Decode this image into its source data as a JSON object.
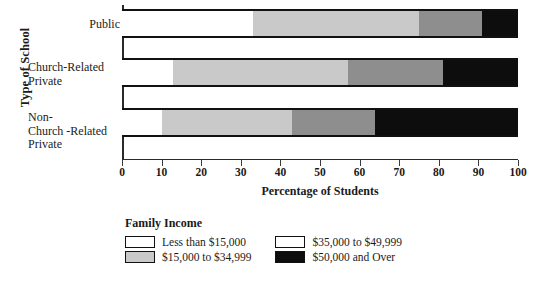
{
  "chart_data": {
    "type": "bar",
    "orientation": "horizontal",
    "stacked": true,
    "stack_mode": "percent",
    "title": "",
    "xlabel": "Percentage of Students",
    "ylabel": "Type of School",
    "xlim": [
      0,
      100
    ],
    "xticks": [
      0,
      10,
      20,
      30,
      40,
      50,
      60,
      70,
      80,
      90,
      100
    ],
    "grid": false,
    "legend_title": "Family Income",
    "legend_position": "bottom",
    "categories": [
      "Public",
      "Church-Related\nPrivate",
      "Non-\nChurch -Related\nPrivate"
    ],
    "series": [
      {
        "name": "Less than $15,000",
        "color": "#ffffff",
        "values": [
          33,
          13,
          10
        ]
      },
      {
        "name": "$15,000 to $34,999",
        "color": "#c9c9c9",
        "values": [
          42,
          44,
          33
        ]
      },
      {
        "name": "$35,000 to $49,999",
        "color": "#8e8e8e",
        "values": [
          16,
          24,
          21
        ]
      },
      {
        "name": "$50,000 and Over",
        "color": "#0d0d0d",
        "values": [
          9,
          19,
          36
        ]
      }
    ],
    "cumulative_boundaries": [
      [
        33,
        75,
        91,
        100
      ],
      [
        13,
        57,
        81,
        100
      ],
      [
        10,
        43,
        64,
        100
      ]
    ]
  },
  "axes": {
    "y_title": "Type of School",
    "x_title": "Percentage of Students",
    "x_ticks": [
      "0",
      "10",
      "20",
      "30",
      "40",
      "50",
      "60",
      "70",
      "80",
      "90",
      "100"
    ]
  },
  "categories": [
    {
      "line1": "Public",
      "line2": "",
      "line3": ""
    },
    {
      "line1": "Church-Related",
      "line2": "Private",
      "line3": ""
    },
    {
      "line1": "Non-",
      "line2": "Church -Related",
      "line3": "Private"
    }
  ],
  "legend": {
    "title": "Family Income",
    "items": [
      {
        "label": "Less than $15,000",
        "swatch": "white-swatch"
      },
      {
        "label": "$35,000 to $49,999",
        "swatch": "white-swatch"
      },
      {
        "label": "$15,000 to $34,999",
        "swatch": "light-gray-swatch"
      },
      {
        "label": "$50,000 and Over",
        "swatch": "black-swatch"
      }
    ]
  }
}
